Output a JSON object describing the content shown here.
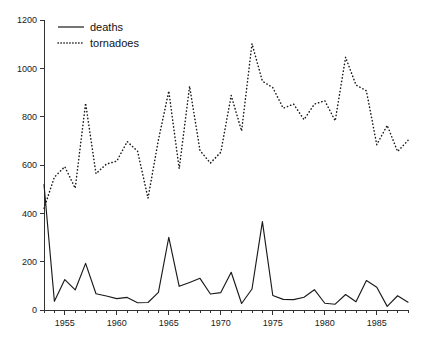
{
  "chart_data": {
    "type": "line",
    "title": "",
    "xlabel": "",
    "ylabel": "",
    "xlim": [
      1953,
      1988
    ],
    "ylim": [
      0,
      1200
    ],
    "grid": false,
    "legend_position": "top-left",
    "y_ticks": [
      0,
      200,
      400,
      600,
      800,
      1000,
      1200
    ],
    "y_tick_labels": [
      "0",
      "200",
      "400",
      "600",
      "800",
      "1000",
      "1200"
    ],
    "x_ticks": [
      1955,
      1960,
      1965,
      1970,
      1975,
      1980,
      1985
    ],
    "x_tick_labels": [
      "1955",
      "1960",
      "1965",
      "1970",
      "1975",
      "1980",
      "1985"
    ],
    "x_minor_tick_step": 1,
    "x": [
      1953,
      1954,
      1955,
      1956,
      1957,
      1958,
      1959,
      1960,
      1961,
      1962,
      1963,
      1964,
      1965,
      1966,
      1967,
      1968,
      1969,
      1970,
      1971,
      1972,
      1973,
      1974,
      1975,
      1976,
      1977,
      1978,
      1979,
      1980,
      1981,
      1982,
      1983,
      1984,
      1985,
      1986,
      1987,
      1988
    ],
    "series": [
      {
        "name": "deaths",
        "style": "solid",
        "color": "#1a1a1a",
        "values": [
          519,
          36,
          126,
          83,
          193,
          67,
          58,
          47,
          52,
          30,
          31,
          73,
          301,
          98,
          114,
          131,
          66,
          72,
          156,
          27,
          87,
          366,
          60,
          44,
          43,
          53,
          84,
          28,
          24,
          64,
          34,
          122,
          94,
          15,
          59,
          32
        ]
      },
      {
        "name": "tornadoes",
        "style": "dotted",
        "color": "#1a1a1a",
        "values": [
          421,
          550,
          593,
          504,
          856,
          564,
          604,
          616,
          697,
          657,
          463,
          704,
          906,
          585,
          926,
          660,
          608,
          653,
          888,
          741,
          1102,
          947,
          920,
          835,
          852,
          788,
          852,
          866,
          783,
          1046,
          931,
          907,
          684,
          764,
          656,
          702
        ]
      }
    ]
  },
  "legend": {
    "entries": [
      {
        "label": "deaths",
        "style": "solid"
      },
      {
        "label": "tornadoes",
        "style": "dotted"
      }
    ]
  }
}
